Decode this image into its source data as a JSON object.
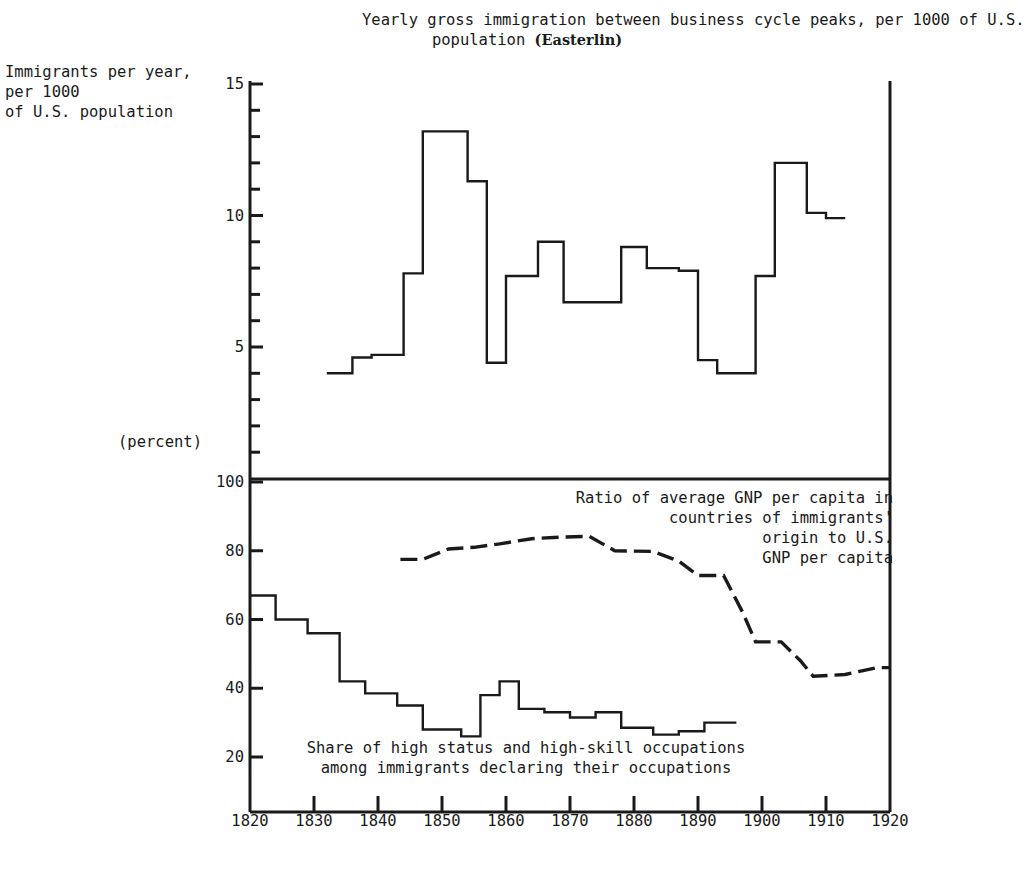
{
  "chart_data": {
    "type": "line",
    "title": "Yearly gross immigration between business cycle peaks, per 1000 of U.S.\npopulation ",
    "title_source": "(Easterlin)",
    "panels": [
      {
        "id": "top",
        "ylabel": "Immigrants per year,\nper 1000\nof U.S. population",
        "ylim": [
          0,
          15
        ],
        "yticks_labeled": [
          5,
          10,
          15
        ],
        "ytick_step": 1,
        "xlim": [
          1820,
          1920
        ],
        "xtick_step": 10,
        "grid": false,
        "series": [
          {
            "name": "Yearly gross immigration per 1000 of U.S. population",
            "style": "step-solid",
            "steps": [
              {
                "x0": 1832,
                "x1": 1836,
                "y": 4.0
              },
              {
                "x0": 1836,
                "x1": 1839,
                "y": 4.6
              },
              {
                "x0": 1839,
                "x1": 1844,
                "y": 4.7
              },
              {
                "x0": 1844,
                "x1": 1847,
                "y": 7.8
              },
              {
                "x0": 1847,
                "x1": 1854,
                "y": 13.2
              },
              {
                "x0": 1854,
                "x1": 1857,
                "y": 11.3
              },
              {
                "x0": 1857,
                "x1": 1860,
                "y": 4.4
              },
              {
                "x0": 1860,
                "x1": 1865,
                "y": 7.7
              },
              {
                "x0": 1865,
                "x1": 1869,
                "y": 9.0
              },
              {
                "x0": 1869,
                "x1": 1873,
                "y": 6.7
              },
              {
                "x0": 1873,
                "x1": 1878,
                "y": 6.7
              },
              {
                "x0": 1878,
                "x1": 1882,
                "y": 8.8
              },
              {
                "x0": 1882,
                "x1": 1887,
                "y": 8.0
              },
              {
                "x0": 1887,
                "x1": 1890,
                "y": 7.9
              },
              {
                "x0": 1890,
                "x1": 1893,
                "y": 4.5
              },
              {
                "x0": 1893,
                "x1": 1899,
                "y": 4.0
              },
              {
                "x0": 1899,
                "x1": 1902,
                "y": 7.7
              },
              {
                "x0": 1902,
                "x1": 1907,
                "y": 12.0
              },
              {
                "x0": 1907,
                "x1": 1910,
                "y": 10.1
              },
              {
                "x0": 1910,
                "x1": 1913,
                "y": 9.9
              }
            ]
          }
        ]
      },
      {
        "id": "bottom",
        "ylabel": "(percent)",
        "ylim": [
          10,
          100
        ],
        "yticks_labeled": [
          20,
          40,
          60,
          80,
          100
        ],
        "ytick_step": 10,
        "xlim": [
          1820,
          1920
        ],
        "xtick_step": 10,
        "grid": false,
        "series": [
          {
            "name": "Ratio of average GNP per capita in countries of immigrants' origin to U.S. GNP per capita",
            "style": "dashed-line",
            "points": [
              {
                "x": 1843.5,
                "y": 77.5
              },
              {
                "x": 1847,
                "y": 77.5
              },
              {
                "x": 1851,
                "y": 80.5
              },
              {
                "x": 1855,
                "y": 81.0
              },
              {
                "x": 1859,
                "y": 82.0
              },
              {
                "x": 1864,
                "y": 83.5
              },
              {
                "x": 1869,
                "y": 84.0
              },
              {
                "x": 1873,
                "y": 84.2
              },
              {
                "x": 1877,
                "y": 80.0
              },
              {
                "x": 1883,
                "y": 79.8
              },
              {
                "x": 1887,
                "y": 77.0
              },
              {
                "x": 1890,
                "y": 72.8
              },
              {
                "x": 1894,
                "y": 72.8
              },
              {
                "x": 1897,
                "y": 62.0
              },
              {
                "x": 1899,
                "y": 53.5
              },
              {
                "x": 1903,
                "y": 53.5
              },
              {
                "x": 1906,
                "y": 48.0
              },
              {
                "x": 1908,
                "y": 43.5
              },
              {
                "x": 1913,
                "y": 44.0
              },
              {
                "x": 1918,
                "y": 46.0
              },
              {
                "x": 1920,
                "y": 46.0
              }
            ]
          },
          {
            "name": "Share of high status and high-skill occupations among immigrants declaring their occupations",
            "style": "step-solid",
            "steps": [
              {
                "x0": 1820,
                "x1": 1824,
                "y": 67.0
              },
              {
                "x0": 1824,
                "x1": 1829,
                "y": 60.0
              },
              {
                "x0": 1829,
                "x1": 1834,
                "y": 56.0
              },
              {
                "x0": 1834,
                "x1": 1838,
                "y": 42.0
              },
              {
                "x0": 1838,
                "x1": 1843,
                "y": 38.5
              },
              {
                "x0": 1843,
                "x1": 1847,
                "y": 35.0
              },
              {
                "x0": 1847,
                "x1": 1853,
                "y": 28.0
              },
              {
                "x0": 1853,
                "x1": 1856,
                "y": 26.0
              },
              {
                "x0": 1856,
                "x1": 1859,
                "y": 38.0
              },
              {
                "x0": 1859,
                "x1": 1862,
                "y": 42.0
              },
              {
                "x0": 1862,
                "x1": 1866,
                "y": 34.0
              },
              {
                "x0": 1866,
                "x1": 1870,
                "y": 33.0
              },
              {
                "x0": 1870,
                "x1": 1874,
                "y": 31.5
              },
              {
                "x0": 1874,
                "x1": 1878,
                "y": 33.0
              },
              {
                "x0": 1878,
                "x1": 1883,
                "y": 28.5
              },
              {
                "x0": 1883,
                "x1": 1887,
                "y": 26.5
              },
              {
                "x0": 1887,
                "x1": 1891,
                "y": 27.5
              },
              {
                "x0": 1891,
                "x1": 1896,
                "y": 30.0
              }
            ]
          }
        ]
      }
    ],
    "x_ticklabels": [
      "1820",
      "1830",
      "1840",
      "1850",
      "1860",
      "1870",
      "1880",
      "1890",
      "1900",
      "1910",
      "1920"
    ],
    "annotations": [
      {
        "id": "gnp",
        "text": "Ratio of average GNP per capita in\ncountries of immigrants'\norigin to U.S.\nGNP per capita"
      },
      {
        "id": "share",
        "text": "Share of high status and high-skill occupations\namong immigrants declaring their occupations"
      }
    ],
    "colors": {
      "line": "#1a1a1a",
      "axis": "#1a1a1a",
      "background": "#ffffff"
    }
  }
}
